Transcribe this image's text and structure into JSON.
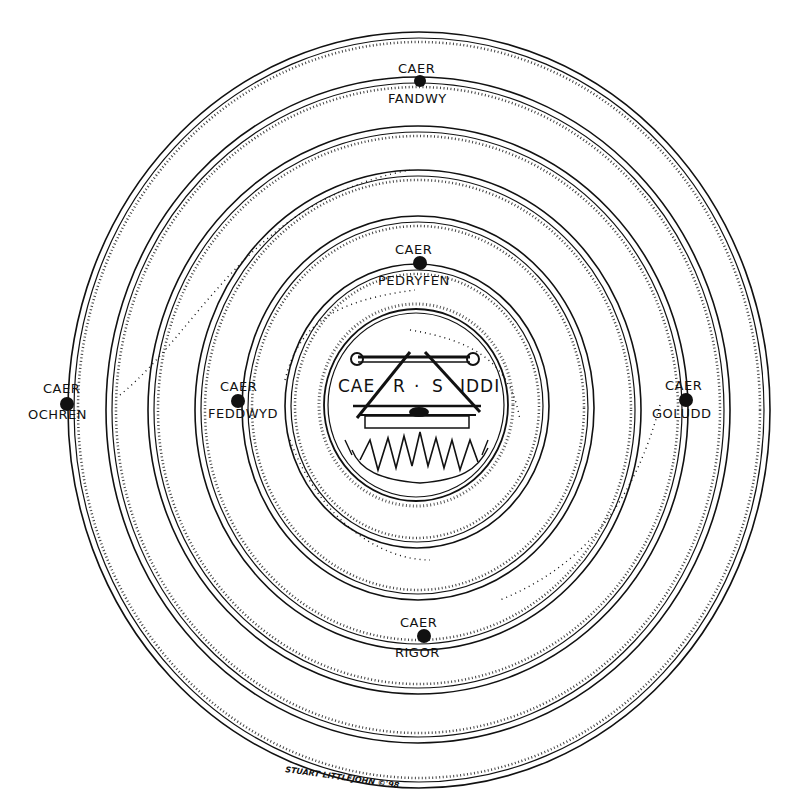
{
  "diagram": {
    "type": "concentric-ring-illustration",
    "style": "black ink line drawing with stippled ring edges on white",
    "colors": {
      "ink": "#111111",
      "background": "#ffffff"
    },
    "center": {
      "label": "CAER · S IDDI",
      "label_parts": [
        "CAE",
        "R",
        "·",
        "S",
        "IDDI"
      ],
      "depiction": "cauldron hung from tripod/bar over flames"
    },
    "castles": [
      {
        "id": "fandwy",
        "line1": "CAER",
        "line2": "FANDWY",
        "position": "top"
      },
      {
        "id": "pedryfen",
        "line1": "CAER",
        "line2": "PEDRYFEN",
        "position": "upper-center"
      },
      {
        "id": "ochren",
        "line1": "CAER",
        "line2": "OCHREN",
        "position": "far-left"
      },
      {
        "id": "feddwyd",
        "line1": "CAER",
        "line2": "FEDDWYD",
        "position": "left"
      },
      {
        "id": "goludd",
        "line1": "CAER",
        "line2": "GOLUDD",
        "position": "right"
      },
      {
        "id": "rigor",
        "line1": "CAER",
        "line2": "RIGOR",
        "position": "bottom"
      }
    ],
    "signature": "STUART LITTLEJOHN ©'98"
  }
}
